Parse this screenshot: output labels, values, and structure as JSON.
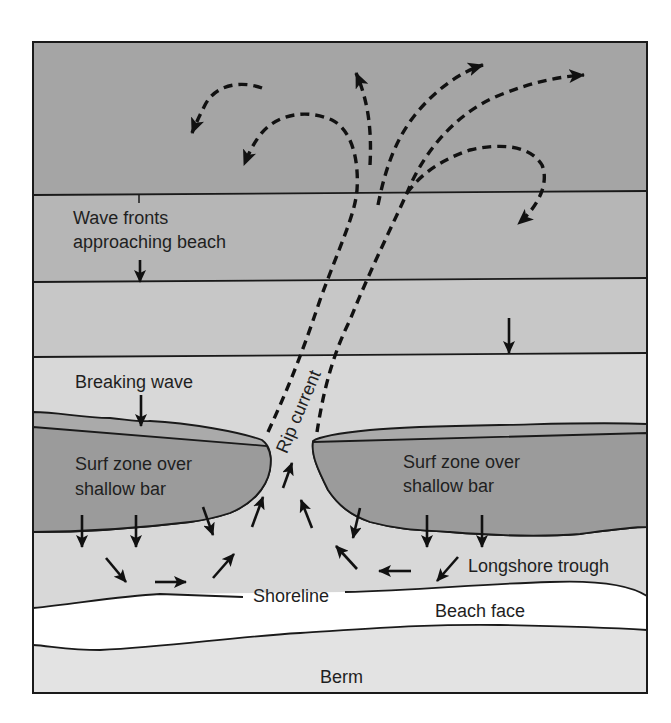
{
  "diagram": {
    "labels": {
      "wave_fronts_line1": "Wave fronts",
      "wave_fronts_line2": "approaching beach",
      "breaking_wave": "Breaking wave",
      "surf_zone_left_line1": "Surf zone over",
      "surf_zone_left_line2": "shallow bar",
      "surf_zone_right_line1": "Surf zone over",
      "surf_zone_right_line2": "shallow bar",
      "rip_current": "Rip current",
      "longshore_trough": "Longshore trough",
      "shoreline": "Shoreline",
      "beach_face": "Beach face",
      "berm": "Berm"
    },
    "colors": {
      "offshore_band": "#a5a5a5",
      "wave_band_1": "#b6b6b6",
      "wave_band_2": "#c7c7c7",
      "nearshore_water": "#d8d8d8",
      "breaking_wave_crest": "#aaaaaa",
      "shallow_bar": "#9b9b9b",
      "beach_face": "#ffffff",
      "berm": "#e3e3e3",
      "ink": "#111111"
    }
  }
}
